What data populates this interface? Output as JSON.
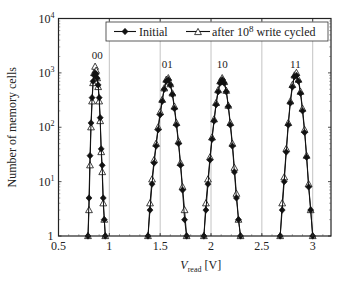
{
  "chart_data": {
    "type": "line",
    "title": "",
    "xlabel": "V_read [V]",
    "xlabel_main": "V",
    "xlabel_sub": "read",
    "xlabel_unit": " [V]",
    "ylabel": "Number of memory cells",
    "yscale": "log",
    "xlim": [
      0.5,
      3.18
    ],
    "ylim": [
      1,
      10000
    ],
    "x_ticks": [
      0.5,
      1,
      1.5,
      2,
      2.5,
      3
    ],
    "x_tick_labels": [
      "0.5",
      "1",
      "1.5",
      "2",
      "2.5",
      "3"
    ],
    "y_ticks": [
      1,
      10,
      100,
      1000,
      10000
    ],
    "y_tick_labels": [
      {
        "base": "1",
        "exp": ""
      },
      {
        "base": "10",
        "exp": "1"
      },
      {
        "base": "10",
        "exp": "2"
      },
      {
        "base": "10",
        "exp": "3"
      },
      {
        "base": "10",
        "exp": "4"
      }
    ],
    "grid": {
      "x": true,
      "y": false
    },
    "legend": {
      "position": "top",
      "entries": [
        {
          "label": "Initial",
          "marker": "filled-diamond"
        },
        {
          "label_pre": "after 10",
          "label_sup": "8",
          "label_post": " write cycled",
          "marker": "open-triangle"
        }
      ]
    },
    "annotations": [
      {
        "text": "00",
        "x": 0.88,
        "y": 1600
      },
      {
        "text": "01",
        "x": 1.57,
        "y": 1100
      },
      {
        "text": "10",
        "x": 2.11,
        "y": 1100
      },
      {
        "text": "11",
        "x": 2.83,
        "y": 1100
      }
    ],
    "series": [
      {
        "name": "Initial",
        "peaks": [
          {
            "state": "00",
            "x": [
              0.79,
              0.8,
              0.81,
              0.82,
              0.83,
              0.84,
              0.85,
              0.86,
              0.87,
              0.88,
              0.89,
              0.9,
              0.91,
              0.92,
              0.93,
              0.94,
              0.95,
              0.96
            ],
            "y": [
              1,
              5,
              30,
              120,
              350,
              700,
              900,
              1000,
              950,
              800,
              600,
              350,
              150,
              40,
              20,
              5,
              2,
              1
            ]
          },
          {
            "state": "01",
            "x": [
              1.38,
              1.4,
              1.42,
              1.44,
              1.46,
              1.48,
              1.5,
              1.52,
              1.54,
              1.56,
              1.58,
              1.6,
              1.62,
              1.64,
              1.66,
              1.68,
              1.7,
              1.72,
              1.74,
              1.76
            ],
            "y": [
              1,
              3,
              9,
              22,
              45,
              90,
              170,
              300,
              500,
              700,
              750,
              600,
              400,
              220,
              110,
              50,
              20,
              7,
              2,
              1
            ]
          },
          {
            "state": "10",
            "x": [
              1.93,
              1.95,
              1.97,
              1.99,
              2.01,
              2.03,
              2.05,
              2.07,
              2.09,
              2.11,
              2.13,
              2.15,
              2.17,
              2.19,
              2.21,
              2.23,
              2.25,
              2.27,
              2.29
            ],
            "y": [
              1,
              3,
              9,
              25,
              60,
              130,
              260,
              450,
              650,
              750,
              650,
              450,
              240,
              110,
              45,
              15,
              5,
              2,
              1
            ]
          },
          {
            "state": "11",
            "x": [
              2.68,
              2.7,
              2.72,
              2.74,
              2.76,
              2.78,
              2.8,
              2.82,
              2.84,
              2.86,
              2.88,
              2.9,
              2.92,
              2.94,
              2.96,
              2.98,
              3.0
            ],
            "y": [
              1,
              3,
              10,
              35,
              110,
              280,
              550,
              850,
              900,
              700,
              420,
              200,
              80,
              28,
              8,
              3,
              1
            ]
          }
        ]
      },
      {
        "name": "after 10^8 write cycled",
        "peaks": [
          {
            "state": "00",
            "x": [
              0.79,
              0.8,
              0.81,
              0.82,
              0.83,
              0.84,
              0.85,
              0.86,
              0.87,
              0.88,
              0.89,
              0.9,
              0.91,
              0.92,
              0.93,
              0.94,
              0.95,
              0.96
            ],
            "y": [
              1,
              3,
              20,
              100,
              300,
              650,
              1000,
              1300,
              1100,
              800,
              550,
              300,
              130,
              35,
              15,
              4,
              2,
              1
            ]
          },
          {
            "state": "01",
            "x": [
              1.38,
              1.4,
              1.42,
              1.44,
              1.46,
              1.48,
              1.5,
              1.52,
              1.54,
              1.56,
              1.58,
              1.6,
              1.62,
              1.64,
              1.66,
              1.68,
              1.7,
              1.72,
              1.74,
              1.76
            ],
            "y": [
              1,
              4,
              11,
              25,
              50,
              100,
              190,
              320,
              520,
              750,
              800,
              620,
              420,
              240,
              120,
              55,
              22,
              8,
              3,
              1
            ]
          },
          {
            "state": "10",
            "x": [
              1.93,
              1.95,
              1.97,
              1.99,
              2.01,
              2.03,
              2.05,
              2.07,
              2.09,
              2.11,
              2.13,
              2.15,
              2.17,
              2.19,
              2.21,
              2.23,
              2.25,
              2.27,
              2.29
            ],
            "y": [
              1,
              4,
              11,
              28,
              65,
              140,
              280,
              480,
              700,
              800,
              680,
              470,
              250,
              120,
              50,
              18,
              6,
              2,
              1
            ]
          },
          {
            "state": "11",
            "x": [
              2.68,
              2.7,
              2.72,
              2.74,
              2.76,
              2.78,
              2.8,
              2.82,
              2.84,
              2.86,
              2.88,
              2.9,
              2.92,
              2.94,
              2.96,
              2.98,
              3.0
            ],
            "y": [
              1,
              4,
              12,
              40,
              120,
              300,
              600,
              900,
              1000,
              750,
              450,
              220,
              90,
              30,
              9,
              3,
              1
            ]
          }
        ]
      }
    ]
  }
}
